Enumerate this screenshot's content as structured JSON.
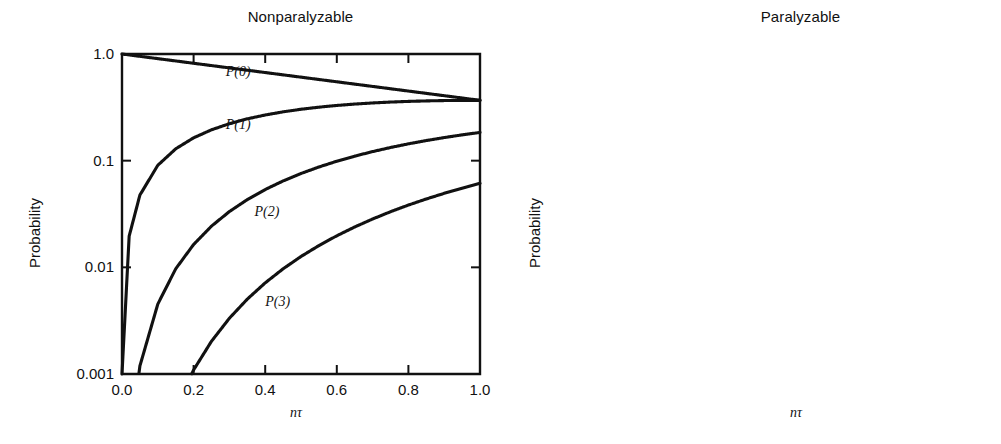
{
  "figure": {
    "background": "#ffffff",
    "ink_color": "#111111"
  },
  "chart_data": [
    {
      "type": "line",
      "title": "Nonparalyzable",
      "xlabel": "nτ",
      "ylabel": "Probability",
      "yscale": "log",
      "ylim": [
        0.001,
        1.0
      ],
      "xlim": [
        0.0,
        1.0
      ],
      "grid": false,
      "legend_position": "inline-curve-labels",
      "xticks": [
        "0.0",
        "0.2",
        "0.4",
        "0.6",
        "0.8",
        "1.0"
      ],
      "xtick_values": [
        0.0,
        0.2,
        0.4,
        0.6,
        0.8,
        1.0
      ],
      "yticks": [
        "1.0",
        "0.1",
        "0.01",
        "0.001"
      ],
      "ytick_values": [
        1.0,
        0.1,
        0.01,
        0.001
      ],
      "x": [
        0.0,
        0.02,
        0.05,
        0.1,
        0.15,
        0.2,
        0.25,
        0.3,
        0.35,
        0.4,
        0.45,
        0.5,
        0.55,
        0.6,
        0.65,
        0.7,
        0.75,
        0.8,
        0.85,
        0.9,
        0.95,
        1.0
      ],
      "series": [
        {
          "name": "P(0)",
          "label": "P(0)",
          "label_at": {
            "x": 0.29,
            "y": 0.62
          },
          "values": [
            1.0,
            0.9802,
            0.9512,
            0.9048,
            0.8607,
            0.8187,
            0.7788,
            0.7408,
            0.7047,
            0.6703,
            0.6376,
            0.6065,
            0.5769,
            0.5488,
            0.522,
            0.4966,
            0.4724,
            0.4493,
            0.4274,
            0.4066,
            0.3867,
            0.3679
          ]
        },
        {
          "name": "P(1)",
          "label": "P(1)",
          "label_at": {
            "x": 0.29,
            "y": 0.2
          },
          "values": [
            0.001,
            0.0196,
            0.0476,
            0.0905,
            0.1291,
            0.1637,
            0.1947,
            0.2222,
            0.2466,
            0.2681,
            0.2869,
            0.3033,
            0.3173,
            0.3293,
            0.3393,
            0.3476,
            0.3543,
            0.3595,
            0.3633,
            0.3659,
            0.3674,
            0.3679
          ]
        },
        {
          "name": "P(2)",
          "label": "P(2)",
          "label_at": {
            "x": 0.37,
            "y": 0.03
          },
          "values": [
            1e-05,
            0.000196,
            0.00119,
            0.00452,
            0.00968,
            0.01637,
            0.02434,
            0.03333,
            0.04315,
            0.05363,
            0.06455,
            0.07582,
            0.08724,
            0.09879,
            0.11028,
            0.12164,
            0.13285,
            0.14377,
            0.15438,
            0.16465,
            0.17451,
            0.18394
          ]
        },
        {
          "name": "P(3)",
          "label": "P(3)",
          "label_at": {
            "x": 0.4,
            "y": 0.0043
          },
          "values": [
            1e-07,
            1.3e-06,
            1.98e-05,
            0.000151,
            0.000484,
            0.001091,
            0.002028,
            0.003333,
            0.005034,
            0.007151,
            0.009683,
            0.012636,
            0.015995,
            0.019759,
            0.023894,
            0.028383,
            0.033212,
            0.038338,
            0.043741,
            0.049394,
            0.055255,
            0.061313
          ]
        }
      ]
    },
    {
      "type": "line",
      "title": "Paralyzable",
      "xlabel": "nτ",
      "ylabel": "Probability",
      "yscale": "log",
      "ylim": [
        0.001,
        1.0
      ],
      "xlim": [
        0.0,
        1.0
      ],
      "grid": false,
      "legend_position": "inline-curve-labels",
      "xticks": [
        "0.0",
        "0.2",
        "0.4",
        "0.6",
        "0.8",
        "1.0"
      ],
      "xtick_values": [
        0.0,
        0.2,
        0.4,
        0.6,
        0.8,
        1.0
      ],
      "yticks": [
        "1.0",
        "0.1",
        "0.01",
        "0.001"
      ],
      "ytick_values": [
        1.0,
        0.1,
        0.01,
        0.001
      ],
      "x": [
        0.0,
        0.02,
        0.05,
        0.1,
        0.15,
        0.2,
        0.25,
        0.3,
        0.35,
        0.4,
        0.45,
        0.5,
        0.55,
        0.6,
        0.65,
        0.7,
        0.75,
        0.8,
        0.85,
        0.9,
        0.95,
        1.0
      ],
      "series": [
        {
          "name": "P(0)",
          "label": "P(0)",
          "label_at": {
            "x": 0.26,
            "y": 0.6
          },
          "values": [
            1.0,
            0.9802,
            0.9512,
            0.9048,
            0.8607,
            0.8187,
            0.7788,
            0.7408,
            0.7047,
            0.6703,
            0.6376,
            0.6065,
            0.5769,
            0.5488,
            0.522,
            0.4966,
            0.4724,
            0.4493,
            0.4274,
            0.4066,
            0.3867,
            0.3679
          ]
        },
        {
          "name": "P(1)",
          "label": "P(1)",
          "label_at": {
            "x": 0.26,
            "y": 0.135
          },
          "values": [
            0.001,
            0.018,
            0.042,
            0.075,
            0.101,
            0.122,
            0.14,
            0.156,
            0.17,
            0.183,
            0.195,
            0.206,
            0.215,
            0.223,
            0.229,
            0.234,
            0.237,
            0.239,
            0.24,
            0.24,
            0.239,
            0.237
          ]
        },
        {
          "name": "P(2)",
          "label": "P(2)",
          "label_at": {
            "x": 0.3,
            "y": 0.03
          },
          "values": [
            1e-05,
            0.00018,
            0.00105,
            0.0039,
            0.0082,
            0.0136,
            0.0198,
            0.0267,
            0.034,
            0.0415,
            0.0492,
            0.0569,
            0.0645,
            0.0719,
            0.079,
            0.0858,
            0.0922,
            0.0982,
            0.1038,
            0.109,
            0.1138,
            0.1181
          ]
        },
        {
          "name": "P(3)",
          "label": "P(3)",
          "label_at": {
            "x": 0.32,
            "y": 0.0085
          },
          "values": [
            1e-07,
            1.2e-06,
            1.75e-05,
            0.000132,
            0.00042,
            0.00094,
            0.00174,
            0.00284,
            0.00427,
            0.00605,
            0.00818,
            0.01068,
            0.01353,
            0.01672,
            0.02023,
            0.02403,
            0.0281,
            0.03241,
            0.03691,
            0.04158,
            0.04637,
            0.05126
          ]
        }
      ]
    }
  ]
}
